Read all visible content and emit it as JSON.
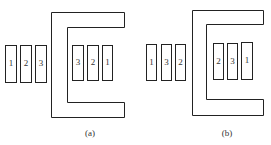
{
  "figures": [
    {
      "caption": "(a)",
      "left_bars": [
        "1",
        "2",
        "3"
      ],
      "right_bars": [
        "3",
        "2",
        "1"
      ]
    },
    {
      "caption": "(b)",
      "left_bars": [
        "1",
        "3",
        "2"
      ],
      "right_bars": [
        "2",
        "3",
        "1"
      ]
    }
  ],
  "colors": {
    "stroke": "#222222",
    "background": "#ffffff"
  }
}
